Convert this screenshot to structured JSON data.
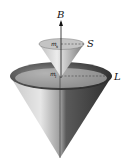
{
  "diagram": {
    "type": "vector-model-cones",
    "labels": {
      "field": "B",
      "spin": "S",
      "orbital": "L",
      "spin_projection": "m",
      "spin_projection_sub": "s",
      "orbital_projection": "m",
      "orbital_projection_sub": "l"
    },
    "colors": {
      "cone_light": "#d9d9d9",
      "cone_dark": "#3a3a3a",
      "rim_inner": "#555555",
      "line": "#111111"
    }
  }
}
